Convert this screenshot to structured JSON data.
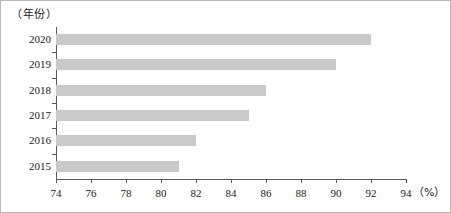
{
  "chart_data": {
    "type": "bar",
    "orientation": "horizontal",
    "title": "",
    "xlabel": "（%）",
    "ylabel": "（年份）",
    "categories": [
      "2020",
      "2019",
      "2018",
      "2017",
      "2016",
      "2015"
    ],
    "values": [
      92,
      90,
      86,
      85,
      82,
      81
    ],
    "series": [
      {
        "name": "",
        "values": [
          92,
          90,
          86,
          85,
          82,
          81
        ]
      }
    ],
    "xlim": [
      74,
      94
    ],
    "xticks": [
      74,
      76,
      78,
      80,
      82,
      84,
      86,
      88,
      90,
      92,
      94
    ],
    "xtick_labels": [
      "74",
      "76",
      "78",
      "80",
      "82",
      "84",
      "86",
      "88",
      "90",
      "92",
      "94"
    ],
    "grid": false,
    "legend": false,
    "bar_color": "#c9c9c9",
    "axis_color": "#5a5a5a"
  },
  "axes": {
    "y_caption": "（年份）",
    "x_unit": "（%）"
  }
}
